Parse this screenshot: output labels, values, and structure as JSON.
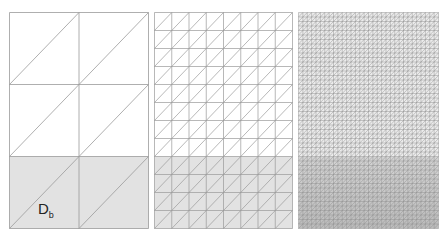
{
  "figure": {
    "colors": {
      "background": "#ffffff",
      "line": "#9a9a9a",
      "line_fine": "#8c8c8c",
      "shade": "#e2e2e2",
      "shade_fine_top": "#d4d4d4",
      "shade_fine_bottom": "#bdbdbd"
    },
    "panels": [
      {
        "name": "coarse",
        "x": 9,
        "y": 12,
        "width": 139,
        "height": 216,
        "cols": 2,
        "rows": 3,
        "shaded_rows": 1
      },
      {
        "name": "medium",
        "x": 154,
        "y": 12,
        "width": 138,
        "height": 216,
        "cols": 8,
        "rows": 12,
        "shaded_rows": 4
      },
      {
        "name": "fine",
        "x": 298,
        "y": 12,
        "width": 140,
        "height": 216,
        "cols": 32,
        "rows": 48,
        "shaded_rows": 16
      }
    ],
    "subdomain_label": {
      "main": "D",
      "sub": "b"
    }
  }
}
